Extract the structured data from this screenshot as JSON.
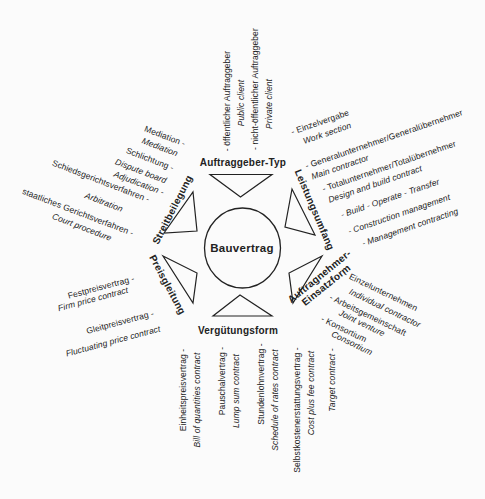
{
  "center_label": "Bauvertrag",
  "colors": {
    "ink": "#222222",
    "background": "#fbfbfb"
  },
  "axes": {
    "top": {
      "header": "Auftraggeber-Typ",
      "lines": [
        {
          "text": "- öffentlicher Auftraggeber",
          "style": "de"
        },
        {
          "text": "Public client",
          "style": "en"
        },
        {
          "text": "- nicht-öffentlicher Auftraggeber",
          "style": "de"
        },
        {
          "text": "Private client",
          "style": "en"
        }
      ]
    },
    "right_upper": {
      "header": "Leistungsumfang",
      "lines": [
        {
          "text": "- Einzelvergabe",
          "style": "de"
        },
        {
          "text": "Work section",
          "style": "en"
        },
        {
          "text": "- Generalunternehmer/Generalübernehmer",
          "style": "de"
        },
        {
          "text": "Main contractor",
          "style": "en"
        },
        {
          "text": "- Totalunternehmer/Totalübernehmer",
          "style": "de"
        },
        {
          "text": "Design and build contract",
          "style": "en"
        },
        {
          "text": "- Build - Operate - Transfer",
          "style": "en"
        },
        {
          "text": "- Construction management",
          "style": "en"
        },
        {
          "text": "- Management contracting",
          "style": "en"
        }
      ]
    },
    "right_lower": {
      "header": "Auftragnehmer-",
      "header2": "Einsatzform",
      "lines": [
        {
          "text": "- Einzelunternehmen",
          "style": "de"
        },
        {
          "text": "Individual contractor",
          "style": "en"
        },
        {
          "text": "- Arbeitsgemeinschaft",
          "style": "de"
        },
        {
          "text": "Joint venture",
          "style": "en"
        },
        {
          "text": "- Konsortium",
          "style": "de"
        },
        {
          "text": "Consortium",
          "style": "en"
        }
      ]
    },
    "bottom": {
      "header": "Vergütungsform",
      "lines": [
        {
          "text": "Einheitspreisvertrag -",
          "style": "de"
        },
        {
          "text": "Bill of quantities contract",
          "style": "en"
        },
        {
          "text": "Pauschalvertrag -",
          "style": "de"
        },
        {
          "text": "Lump sum contract",
          "style": "en"
        },
        {
          "text": "Stundenlohnvertrag -",
          "style": "de"
        },
        {
          "text": "Schedule of rates contract",
          "style": "en"
        },
        {
          "text": "Selbstkostenerstattungsvertrag -",
          "style": "de"
        },
        {
          "text": "Cost plus fee contract",
          "style": "en"
        },
        {
          "text": "Target contract -",
          "style": "en"
        }
      ]
    },
    "left_lower": {
      "header": "Preisgleitung",
      "lines": [
        {
          "text": "Festpreisvertrag -",
          "style": "de"
        },
        {
          "text": "Firm price contract",
          "style": "en"
        },
        {
          "text": "Gleitpreisvertrag -",
          "style": "de"
        },
        {
          "text": "Fluctuating price contract",
          "style": "en"
        }
      ]
    },
    "left_upper": {
      "header": "Streitbeilegung",
      "lines": [
        {
          "text": "Mediation -",
          "style": "de"
        },
        {
          "text": "Mediation",
          "style": "en"
        },
        {
          "text": "Schlichtung -",
          "style": "de"
        },
        {
          "text": "Dispute board",
          "style": "en"
        },
        {
          "text": "Adjudication -",
          "style": "en"
        },
        {
          "text": "Schiedsgerichtsverfahren -",
          "style": "de"
        },
        {
          "text": "Arbitration",
          "style": "en"
        },
        {
          "text": "staatliches Gerichtsverfahren -",
          "style": "de"
        },
        {
          "text": "Court procedure",
          "style": "en"
        }
      ]
    }
  }
}
